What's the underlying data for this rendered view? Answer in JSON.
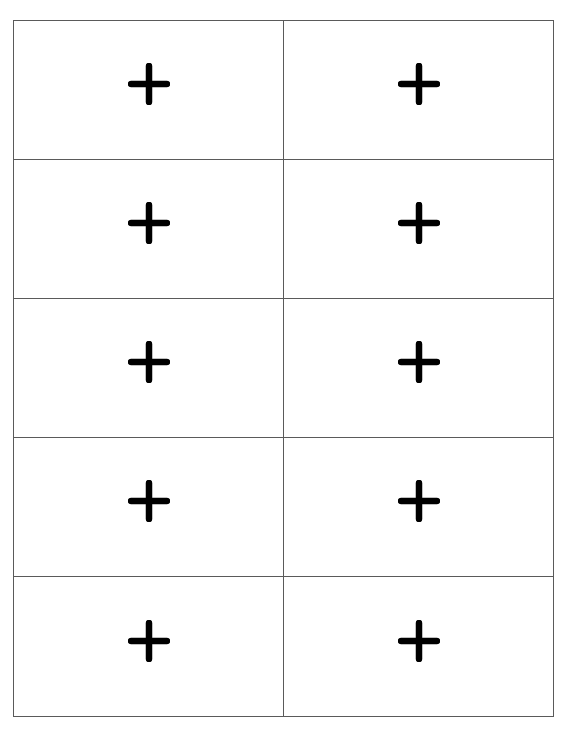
{
  "page": {
    "header_fragment": "",
    "line_color": "#5a5a5a",
    "icon_color": "#000000"
  },
  "grid": {
    "columns": 2,
    "rows": 5,
    "cells": [
      {
        "row": 1,
        "col": 1,
        "icon": "plus-icon"
      },
      {
        "row": 1,
        "col": 2,
        "icon": "plus-icon"
      },
      {
        "row": 2,
        "col": 1,
        "icon": "plus-icon"
      },
      {
        "row": 2,
        "col": 2,
        "icon": "plus-icon"
      },
      {
        "row": 3,
        "col": 1,
        "icon": "plus-icon"
      },
      {
        "row": 3,
        "col": 2,
        "icon": "plus-icon"
      },
      {
        "row": 4,
        "col": 1,
        "icon": "plus-icon"
      },
      {
        "row": 4,
        "col": 2,
        "icon": "plus-icon"
      },
      {
        "row": 5,
        "col": 1,
        "icon": "plus-icon"
      },
      {
        "row": 5,
        "col": 2,
        "icon": "plus-icon"
      }
    ]
  }
}
